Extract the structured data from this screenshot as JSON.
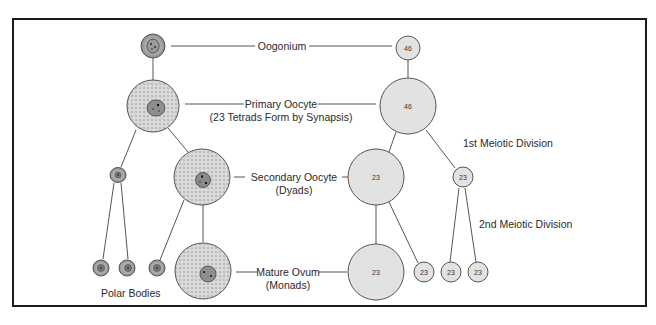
{
  "diagram": {
    "labels": {
      "oogonium": "Oogonium",
      "primary_oocyte": "Primary Oocyte",
      "primary_oocyte_note": "(23 Tetrads Form by Synapsis)",
      "secondary_oocyte": "Secondary Oocyte",
      "secondary_oocyte_note": "(Dyads)",
      "mature_ovum": "Mature Ovum",
      "mature_ovum_note": "(Monads)",
      "polar_bodies": "Polar Bodies",
      "first_division": "1st Meiotic Division",
      "second_division": "2nd Meiotic Division"
    },
    "chromosome_counts": {
      "oogonium": "46",
      "primary_oocyte": "46",
      "secondary_oocyte": "23",
      "first_polar_body": "23",
      "mature_ovum": "23",
      "polar_body_a": "23",
      "polar_body_b": "23",
      "polar_body_c": "23"
    },
    "colors": {
      "cell_fill": "#d9d9d9",
      "cell_stroke": "#555555",
      "nucleus_fill": "#8a8a8a",
      "schematic_fill": "#e2e2e2",
      "line": "#444444"
    }
  }
}
